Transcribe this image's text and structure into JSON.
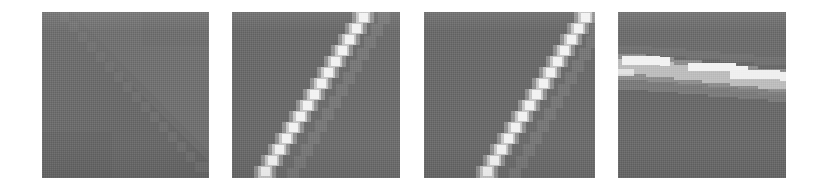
{
  "figure": {
    "title": "",
    "background_color": "#ffffff",
    "width": 826,
    "height": 189,
    "panel_count": 4
  },
  "palette": {
    "background": "#ffffff",
    "panel_gray": "#6b6b6b",
    "panel_gray_light": "#767676",
    "panel_gray_dark": "#606060",
    "line_bright": "#f2f2f2",
    "line_mid": "#b9b9b9",
    "line_soft": "#969696",
    "line_faint": "#7d7d7d"
  },
  "panels": [
    {
      "id": "panel-1",
      "label": "panel-1",
      "x": 42,
      "y": 12,
      "width": 167,
      "height": 166,
      "content": "uniform-gray-with-faint-diagonal-boundary",
      "feature": "faint-diagonal-edge",
      "line_visible": false,
      "line_brightness": "none",
      "line_orientation": "diagonal-lower-left-to-upper-right",
      "line_angle_deg": 62
    },
    {
      "id": "panel-2",
      "label": "panel-2",
      "x": 232,
      "y": 12,
      "width": 168,
      "height": 166,
      "content": "bright-jagged-diagonal-line",
      "feature": "stepped-aliased-bright-line",
      "line_visible": true,
      "line_brightness": "high",
      "line_orientation": "diagonal-lower-left-to-upper-right",
      "line_angle_deg": 62,
      "start_rel": [
        0.04,
        1.0
      ],
      "end_rel": [
        0.82,
        0.0
      ]
    },
    {
      "id": "panel-3",
      "label": "panel-3",
      "x": 424,
      "y": 12,
      "width": 171,
      "height": 166,
      "content": "bright-jagged-diagonal-line",
      "feature": "stepped-aliased-bright-line",
      "line_visible": true,
      "line_brightness": "high",
      "line_orientation": "diagonal-lower-left-to-upper-right",
      "line_angle_deg": 64,
      "start_rel": [
        0.25,
        1.0
      ],
      "end_rel": [
        1.0,
        0.0
      ]
    },
    {
      "id": "panel-4",
      "label": "panel-4",
      "x": 618,
      "y": 12,
      "width": 168,
      "height": 166,
      "content": "bright-near-horizontal-band",
      "feature": "stepped-aliased-bright-band",
      "line_visible": true,
      "line_brightness": "high",
      "line_orientation": "near-horizontal-shallow-descending",
      "line_angle_deg": 6,
      "start_rel": [
        0.0,
        0.32
      ],
      "end_rel": [
        1.0,
        0.46
      ]
    }
  ],
  "chart_data": {
    "type": "heatmap",
    "title": "",
    "subtitle": "",
    "xlabel": "",
    "ylabel": "",
    "legend": [],
    "annotations": [],
    "grid": false,
    "categories": [
      "panel-1",
      "panel-2",
      "panel-3",
      "panel-4"
    ],
    "series": [
      {
        "name": "line contrast (0-1)",
        "values": [
          0.05,
          0.95,
          0.95,
          0.9
        ]
      },
      {
        "name": "line angle (degrees)",
        "values": [
          62,
          62,
          64,
          6
        ]
      },
      {
        "name": "background gray level (0-255)",
        "values": [
          107,
          107,
          107,
          107
        ]
      }
    ],
    "ylim": [
      0,
      1
    ]
  }
}
